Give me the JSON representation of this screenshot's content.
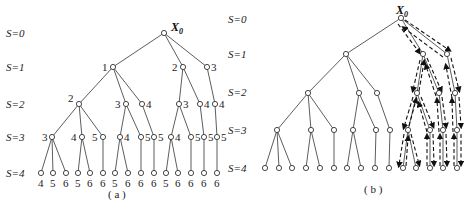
{
  "figure": {
    "panel_a": {
      "caption": "( a )",
      "root_label": "X",
      "root_sub": "0",
      "levels": [
        "S=0",
        "S=1",
        "S=2",
        "S=3",
        "S=4"
      ],
      "nodes": {
        "s1": [
          "1",
          "2",
          "3"
        ],
        "s2": [
          "2",
          "3",
          "4",
          "3",
          "4",
          "4"
        ],
        "s3": [
          "3",
          "4",
          "5",
          "4",
          "5",
          "5",
          "4",
          "5",
          "5",
          "5"
        ],
        "s4": [
          "4",
          "5",
          "6",
          "5",
          "6",
          "6",
          "5",
          "6",
          "6",
          "6",
          "5",
          "6",
          "6",
          "6",
          "6"
        ]
      }
    },
    "panel_b": {
      "caption": "( b )",
      "root_label": "X",
      "root_sub": "0",
      "levels": [
        "S=0",
        "S=1",
        "S=2",
        "S=3",
        "S=4"
      ],
      "description": "Same tree without node labels; dashed arrows trace depth-first traversal of the right subtrees"
    },
    "colors": {
      "line": "#333333",
      "node_fill": "#ffffff",
      "text": "#222222"
    }
  }
}
